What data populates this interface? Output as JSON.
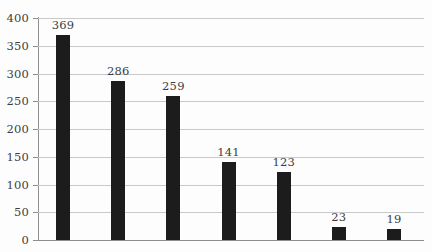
{
  "chart_data": {
    "type": "bar",
    "title": "",
    "subtitle": "",
    "xlabel": "",
    "ylabel": "",
    "categories": [
      "",
      "",
      "",
      "",
      "",
      "",
      ""
    ],
    "values": [
      369,
      286,
      259,
      141,
      123,
      23,
      19
    ],
    "value_labels": [
      "369",
      "286",
      "259",
      "141",
      "123",
      "23",
      "19"
    ],
    "ylim": [
      0,
      400
    ],
    "ytick_step": 50,
    "ytick_labels": [
      "400",
      "350",
      "300",
      "250",
      "200",
      "150",
      "100",
      "50",
      "0"
    ],
    "ytick_values": [
      400,
      350,
      300,
      250,
      200,
      150,
      100,
      50,
      0
    ],
    "xtick_labels": [],
    "grid": "horizontal",
    "legend": "none",
    "annotations": [],
    "bar_color": "#1c1c1c",
    "gridline_color": "#c9c9c9",
    "axis_color": "#8f8f8f",
    "label_color": "#3d3d3d",
    "background_color": "#fdfdfd"
  }
}
